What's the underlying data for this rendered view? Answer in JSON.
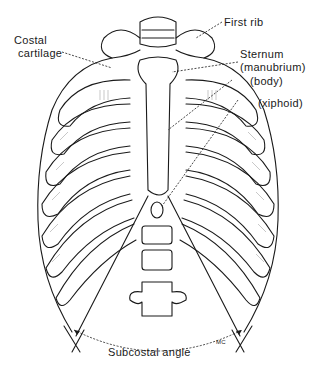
{
  "figure": {
    "labels": {
      "costal_cartilage_line1": "Costal",
      "costal_cartilage_line2": "cartilage",
      "first_rib": "First rib",
      "sternum": "Sternum",
      "manubrium": "(manubrium)",
      "body": "(body)",
      "xiphoid": "(xiphoid)",
      "subcostal_angle": "Subcostal angle",
      "artist_initials": "MC"
    },
    "colors": {
      "ink": "#1a1a1a",
      "background": "#ffffff"
    }
  }
}
